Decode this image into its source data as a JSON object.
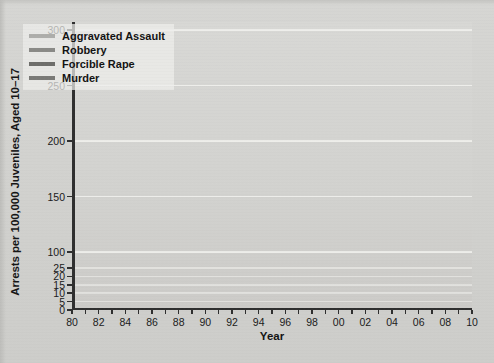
{
  "chart_data": {
    "type": "line",
    "title": "",
    "xlabel": "Year",
    "ylabel": "Arrests per 100,000 Juveniles, Aged 10–17",
    "x": [
      1980,
      1981,
      1982,
      1983,
      1984,
      1985,
      1986,
      1987,
      1988,
      1989,
      1990,
      1991,
      1992,
      1993,
      1994,
      1995,
      1996,
      1997,
      1998,
      1999,
      2000,
      2001,
      2002,
      2003,
      2004,
      2005,
      2006,
      2007,
      2008
    ],
    "xtick_labels": [
      "80",
      "82",
      "84",
      "86",
      "88",
      "90",
      "92",
      "94",
      "96",
      "98",
      "00",
      "02",
      "04",
      "06",
      "08",
      "10"
    ],
    "xtick_values": [
      1980,
      1982,
      1984,
      1986,
      1988,
      1990,
      1992,
      1994,
      1996,
      1998,
      2000,
      2002,
      2004,
      2006,
      2008,
      2010
    ],
    "xlim": [
      1980,
      2010
    ],
    "ytick_labels": [
      "0",
      "5",
      "10",
      "15",
      "20",
      "25",
      "100",
      "150",
      "200",
      "250",
      "300"
    ],
    "ytick_values": [
      0,
      5,
      10,
      15,
      20,
      25,
      100,
      150,
      200,
      250,
      300
    ],
    "ylim": [
      0,
      300
    ],
    "axis_note": "broken y-axis: 0-25 compressed band at bottom, then 100-300 upper band",
    "grid": true,
    "grid_color": "#f2f2ef",
    "legend_position": "top-left",
    "series": [
      {
        "name": "Aggravated Assault",
        "color": "#aeaeab",
        "values": [
          147,
          152,
          146,
          142,
          141,
          146,
          156,
          163,
          166,
          175,
          196,
          223,
          243,
          264,
          285,
          292,
          288,
          275,
          258,
          245,
          227,
          219,
          210,
          200,
          186,
          178,
          178,
          172,
          167
        ]
      },
      {
        "name": "Robbery",
        "color": "#8a8a87",
        "values": [
          170,
          158,
          142,
          132,
          137,
          127,
          130,
          121,
          117,
          125,
          155,
          177,
          175,
          170,
          200,
          203,
          193,
          176,
          150,
          123,
          108,
          105,
          97,
          86,
          84,
          60,
          90,
          108,
          107
        ]
      },
      {
        "name": "Forcible Rape",
        "color": "#6e6e6b",
        "values": [
          16,
          16.5,
          17,
          17.5,
          18,
          18.5,
          20,
          21,
          21,
          21.5,
          22,
          22,
          23,
          22.5,
          22,
          23,
          24,
          23.5,
          22.5,
          21,
          19.5,
          18.5,
          18,
          17,
          16,
          15,
          14,
          13.5,
          13
        ]
      },
      {
        "name": "Murder",
        "color": "#7a7a77",
        "values": [
          6,
          6.5,
          7,
          6.5,
          6,
          6,
          6.5,
          7.5,
          9,
          11,
          12.5,
          14,
          15,
          15,
          14.5,
          13,
          13.5,
          12,
          10,
          8.5,
          7.5,
          7,
          6.5,
          6.5,
          6.5,
          6.5,
          7,
          7,
          7
        ]
      }
    ]
  },
  "legend": {
    "items": [
      {
        "label": "Aggravated Assault"
      },
      {
        "label": "Robbery"
      },
      {
        "label": "Forcible Rape"
      },
      {
        "label": "Murder"
      }
    ]
  }
}
